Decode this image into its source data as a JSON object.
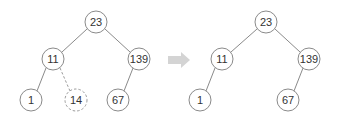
{
  "diagram": {
    "colors": {
      "stroke": "#8a8a8a",
      "arrow": "#d4d4d4",
      "text": "#333333"
    },
    "before": {
      "nodes": [
        {
          "id": "n23",
          "label": "23",
          "x": 96,
          "y": 22
        },
        {
          "id": "n11",
          "label": "11",
          "x": 53,
          "y": 59
        },
        {
          "id": "n139",
          "label": "139",
          "x": 139,
          "y": 59
        },
        {
          "id": "n1",
          "label": "1",
          "x": 31,
          "y": 100
        },
        {
          "id": "n14",
          "label": "14",
          "x": 76,
          "y": 100,
          "removed": true
        },
        {
          "id": "n67",
          "label": "67",
          "x": 118,
          "y": 100
        }
      ]
    },
    "after": {
      "nodes": [
        {
          "id": "m23",
          "label": "23",
          "x": 266,
          "y": 22
        },
        {
          "id": "m11",
          "label": "11",
          "x": 222,
          "y": 59
        },
        {
          "id": "m139",
          "label": "139",
          "x": 309,
          "y": 59
        },
        {
          "id": "m1",
          "label": "1",
          "x": 200,
          "y": 100
        },
        {
          "id": "m67",
          "label": "67",
          "x": 288,
          "y": 100
        }
      ]
    },
    "arrow": {
      "direction": "right"
    }
  }
}
